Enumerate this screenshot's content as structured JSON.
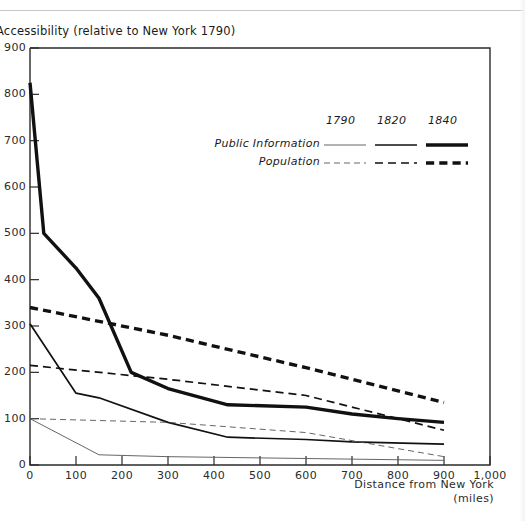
{
  "chart_data": {
    "type": "line",
    "title": "Accessibility (relative to New York 1790)",
    "xlabel": "Distance from New York (miles)",
    "ylabel": "Accessibility (relative to New York 1790)",
    "xlim": [
      0,
      1000
    ],
    "ylim": [
      0,
      900
    ],
    "grid": false,
    "legend_position": "upper-right-inside",
    "x_ticks": [
      "0",
      "100",
      "200",
      "300",
      "400",
      "500",
      "600",
      "700",
      "800",
      "900",
      "1,000"
    ],
    "x_tick_values": [
      0,
      100,
      200,
      300,
      400,
      500,
      600,
      700,
      800,
      900,
      1000
    ],
    "y_ticks": [
      "0",
      "100",
      "200",
      "300",
      "400",
      "500",
      "600",
      "700",
      "800",
      "900"
    ],
    "y_tick_values": [
      0,
      100,
      200,
      300,
      400,
      500,
      600,
      700,
      800,
      900
    ],
    "legend": {
      "years": [
        "1790",
        "1820",
        "1840"
      ],
      "rows": [
        {
          "label": "Public Information",
          "style": "solid"
        },
        {
          "label": "Population",
          "style": "dashed"
        }
      ]
    },
    "series": [
      {
        "name": "Public Information 1840",
        "measure": "Public Information",
        "year": "1840",
        "style": "solid",
        "width": 3.4,
        "x": [
          0,
          30,
          100,
          150,
          220,
          300,
          430,
          600,
          700,
          800,
          900
        ],
        "values": [
          825,
          500,
          425,
          360,
          200,
          165,
          130,
          125,
          110,
          100,
          92
        ]
      },
      {
        "name": "Population 1840",
        "measure": "Population",
        "year": "1840",
        "style": "dashed",
        "width": 3.4,
        "x": [
          0,
          300,
          600,
          900
        ],
        "values": [
          340,
          280,
          210,
          135
        ]
      },
      {
        "name": "Public Information 1820",
        "measure": "Public Information",
        "year": "1820",
        "style": "solid",
        "width": 1.7,
        "x": [
          0,
          100,
          150,
          300,
          430,
          600,
          700,
          900
        ],
        "values": [
          305,
          155,
          145,
          92,
          60,
          55,
          50,
          45
        ]
      },
      {
        "name": "Population 1820",
        "measure": "Population",
        "year": "1820",
        "style": "dashed",
        "width": 1.7,
        "x": [
          0,
          300,
          600,
          900
        ],
        "values": [
          215,
          185,
          150,
          75
        ]
      },
      {
        "name": "Public Information 1790",
        "measure": "Public Information",
        "year": "1790",
        "style": "solid",
        "width": 0.9,
        "x": [
          0,
          150,
          300,
          600,
          900
        ],
        "values": [
          100,
          22,
          18,
          14,
          10
        ]
      },
      {
        "name": "Population 1790",
        "measure": "Population",
        "year": "1790",
        "style": "dashed",
        "width": 0.9,
        "x": [
          0,
          300,
          600,
          900
        ],
        "values": [
          100,
          92,
          70,
          18
        ]
      }
    ]
  },
  "axis": {
    "x_caption_line1": "Distance from New York",
    "x_caption_line2": "(miles)"
  }
}
